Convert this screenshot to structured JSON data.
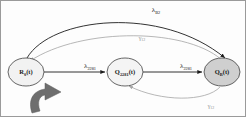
{
  "figure": {
    "type": "state-transition-diagram",
    "background_color": "#fdfdfd",
    "border_color": "#9a9a9a"
  },
  "nodes": [
    {
      "id": "node-r0",
      "name": "node-r0",
      "base": "R",
      "subscript": "0",
      "suffix": "(t)",
      "full_label": "R0(t)",
      "cx": 25,
      "cy": 71,
      "rx": 18,
      "ry": 14,
      "fill": "#f2f2f2",
      "stroke": "#555555"
    },
    {
      "id": "node-q2281",
      "name": "node-q2281",
      "base": "Q",
      "subscript": "2281",
      "suffix": "(t)",
      "full_label": "Q2281(t)",
      "cx": 124,
      "cy": 71,
      "rx": 18,
      "ry": 14,
      "fill": "#f4f4f4",
      "stroke": "#555555"
    },
    {
      "id": "node-qb",
      "name": "node-qb",
      "base": "Q",
      "subscript": "B",
      "suffix": "(t)",
      "full_label": "QB(t)",
      "cx": 221,
      "cy": 71,
      "rx": 18,
      "ry": 14,
      "fill": "#cfcfcf",
      "stroke": "#555555"
    }
  ],
  "edges": [
    {
      "id": "edge-lambda-2281-left",
      "name": "edge-r0-to-q2281",
      "label_base": "λ",
      "label_sub": "2281",
      "label_x": 89,
      "label_y": 67,
      "stroke": "#1c1c1c",
      "kind": "straight"
    },
    {
      "id": "edge-lambda-2281-right",
      "name": "edge-q2281-to-qb",
      "label_base": "λ",
      "label_sub": "2281",
      "label_x": 185,
      "label_y": 67,
      "stroke": "#1c1c1c",
      "kind": "straight"
    },
    {
      "id": "edge-lambda-b2",
      "name": "edge-r0-to-qb-top",
      "label_base": "λ",
      "label_sub": "B2",
      "label_x": 155,
      "label_y": 11,
      "stroke": "#1c1c1c",
      "kind": "arc-top"
    },
    {
      "id": "edge-gamma-12-top",
      "name": "edge-qb-to-r0-return",
      "label_base": "γ",
      "label_sub": "12",
      "label_x": 141,
      "label_y": 39,
      "stroke": "#a5a5a5",
      "kind": "arc-top-inner"
    },
    {
      "id": "edge-gamma-12-bottom",
      "name": "edge-qb-to-q2281-return",
      "label_base": "γ",
      "label_sub": "12",
      "label_x": 210,
      "label_y": 107,
      "stroke": "#a5a5a5",
      "kind": "arc-bottom"
    }
  ],
  "annotations": [
    {
      "id": "curved-pointer-arrow",
      "name": "curved-pointer-arrow",
      "description": "thick curved arrow",
      "fill": "#6e6e6e"
    }
  ]
}
